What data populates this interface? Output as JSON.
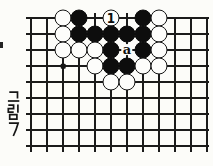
{
  "figure": {
    "label": "그림 7"
  },
  "board": {
    "columns": 12,
    "rows": 9,
    "cell": 16,
    "origin_x": 31,
    "origin_y": 18,
    "line_color": "#1b1b1b",
    "paper_color": "#fcfcf9",
    "stone_colors": {
      "black": "#0d0d0d",
      "white": "#fdfdfb"
    },
    "star_points": [
      {
        "col": 2,
        "row": 3
      }
    ],
    "stones": [
      {
        "col": 2,
        "row": 0,
        "color": "white"
      },
      {
        "col": 3,
        "row": 0,
        "color": "black"
      },
      {
        "col": 5,
        "row": 0,
        "color": "white",
        "marker": "1"
      },
      {
        "col": 7,
        "row": 0,
        "color": "black"
      },
      {
        "col": 8,
        "row": 0,
        "color": "white"
      },
      {
        "col": 2,
        "row": 1,
        "color": "white"
      },
      {
        "col": 3,
        "row": 1,
        "color": "black"
      },
      {
        "col": 4,
        "row": 1,
        "color": "black"
      },
      {
        "col": 5,
        "row": 1,
        "color": "black"
      },
      {
        "col": 6,
        "row": 1,
        "color": "black"
      },
      {
        "col": 7,
        "row": 1,
        "color": "black"
      },
      {
        "col": 8,
        "row": 1,
        "color": "white"
      },
      {
        "col": 2,
        "row": 2,
        "color": "white"
      },
      {
        "col": 3,
        "row": 2,
        "color": "white"
      },
      {
        "col": 4,
        "row": 2,
        "color": "white"
      },
      {
        "col": 5,
        "row": 2,
        "color": "black"
      },
      {
        "col": 7,
        "row": 2,
        "color": "black"
      },
      {
        "col": 8,
        "row": 2,
        "color": "white"
      },
      {
        "col": 4,
        "row": 3,
        "color": "white"
      },
      {
        "col": 5,
        "row": 3,
        "color": "black"
      },
      {
        "col": 6,
        "row": 3,
        "color": "black"
      },
      {
        "col": 7,
        "row": 3,
        "color": "white"
      },
      {
        "col": 8,
        "row": 3,
        "color": "white"
      },
      {
        "col": 5,
        "row": 4,
        "color": "white"
      },
      {
        "col": 6,
        "row": 4,
        "color": "white"
      }
    ],
    "point_labels": [
      {
        "col": 6,
        "row": 2,
        "text": "a"
      }
    ]
  }
}
